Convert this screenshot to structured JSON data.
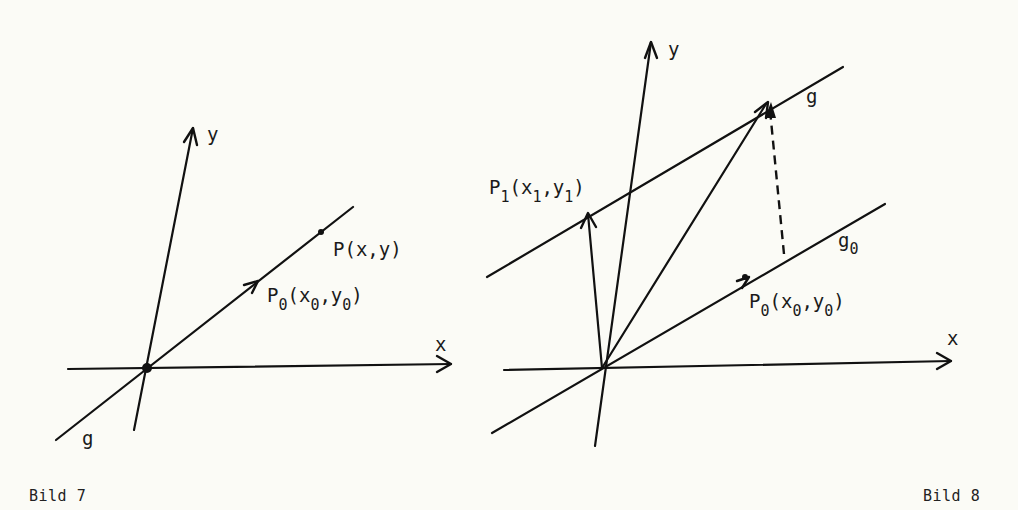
{
  "figures": [
    {
      "id": "bild7",
      "caption": "Bild 7",
      "labels": {
        "y_axis": "y",
        "x_axis": "x",
        "line": "g",
        "point_p": "P(x,y)",
        "point_p0": {
          "main": "P",
          "sub": "0",
          "open": "(x",
          "sub_x": "0",
          "mid": ",y",
          "sub_y": "0",
          "close": ")"
        }
      }
    },
    {
      "id": "bild8",
      "caption": "Bild 8",
      "labels": {
        "y_axis": "y",
        "x_axis": "x",
        "line_g": "g",
        "line_g0": {
          "main": "g",
          "sub": "0"
        },
        "point_p1": {
          "main": "P",
          "sub": "1",
          "open": "(x",
          "sub_x": "1",
          "mid": ",y",
          "sub_y": "1",
          "close": ")"
        },
        "point_p0": {
          "main": "P",
          "sub": "0",
          "open": "(x",
          "sub_x": "0",
          "mid": ",y",
          "sub_y": "0",
          "close": ")"
        }
      }
    }
  ]
}
